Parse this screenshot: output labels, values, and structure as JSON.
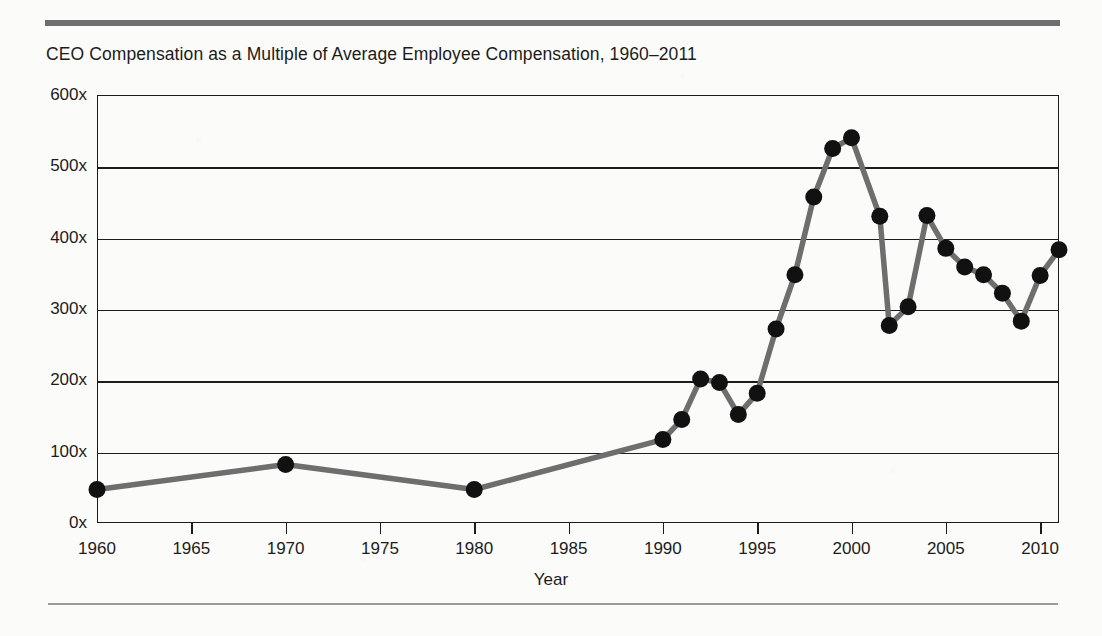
{
  "figure": {
    "title": "CEO Compensation as a Multiple of Average Employee Compensation, 1960–2011",
    "top_rule_color": "#6e6e6e",
    "bottom_rule_color": "#9a9a9a",
    "background_color": "#fbfbf9"
  },
  "chart_data": {
    "type": "line",
    "title": "CEO Compensation as a Multiple of Average Employee Compensation, 1960–2011",
    "xlabel": "Year",
    "ylabel": "",
    "xlim": [
      1960,
      2011
    ],
    "ylim": [
      0,
      600
    ],
    "grid": true,
    "legend": "none",
    "line_color": "#6e6e6e",
    "marker_color": "#111111",
    "marker_shape": "circle",
    "xticks": [
      1960,
      1965,
      1970,
      1975,
      1980,
      1985,
      1990,
      1995,
      2000,
      2005,
      2010
    ],
    "xtick_labels": [
      "1960",
      "1965",
      "1970",
      "1975",
      "1980",
      "1985",
      "1990",
      "1995",
      "2000",
      "2005",
      "2010"
    ],
    "yticks": [
      0,
      100,
      200,
      300,
      400,
      500,
      600
    ],
    "ytick_labels": [
      "0x",
      "100x",
      "200x",
      "300x",
      "400x",
      "500x",
      "600x"
    ],
    "x": [
      1960,
      1970,
      1980,
      1990,
      1991,
      1992,
      1993,
      1994,
      1995,
      1996,
      1997,
      1998,
      1999,
      2000,
      2001.5,
      2002,
      2003,
      2004,
      2005,
      2006,
      2007,
      2008,
      2009,
      2010,
      2011
    ],
    "values": [
      47,
      82,
      47,
      117,
      145,
      202,
      197,
      152,
      182,
      272,
      348,
      457,
      525,
      540,
      430,
      277,
      303,
      431,
      385,
      359,
      348,
      322,
      283,
      347,
      383
    ],
    "series": [
      {
        "name": "CEO compensation multiple",
        "values": [
          47,
          82,
          47,
          117,
          145,
          202,
          197,
          152,
          182,
          272,
          348,
          457,
          525,
          540,
          430,
          277,
          303,
          431,
          385,
          359,
          348,
          322,
          283,
          347,
          383
        ]
      }
    ]
  },
  "axes": {
    "x_axis_title": "Year"
  }
}
